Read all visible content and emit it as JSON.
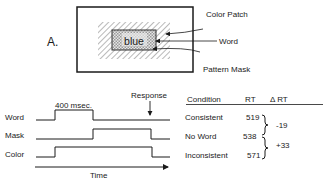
{
  "panel_label": "A.",
  "stimulus": {
    "word": "blue",
    "callouts": [
      "Color Patch",
      "Word",
      "Pattern Mask"
    ]
  },
  "timing": {
    "duration_label": "400 msec.",
    "response_label": "Response",
    "rows": [
      "Word",
      "Mask",
      "Color"
    ],
    "axis_label": "Time"
  },
  "table": {
    "headers": [
      "Condition",
      "RT",
      "Δ RT"
    ],
    "rows": [
      {
        "condition": "Consistent",
        "rt": "519"
      },
      {
        "condition": "No Word",
        "rt": "538"
      },
      {
        "condition": "Inconsistent",
        "rt": "571"
      }
    ],
    "deltas": [
      "-19",
      "+33"
    ]
  }
}
